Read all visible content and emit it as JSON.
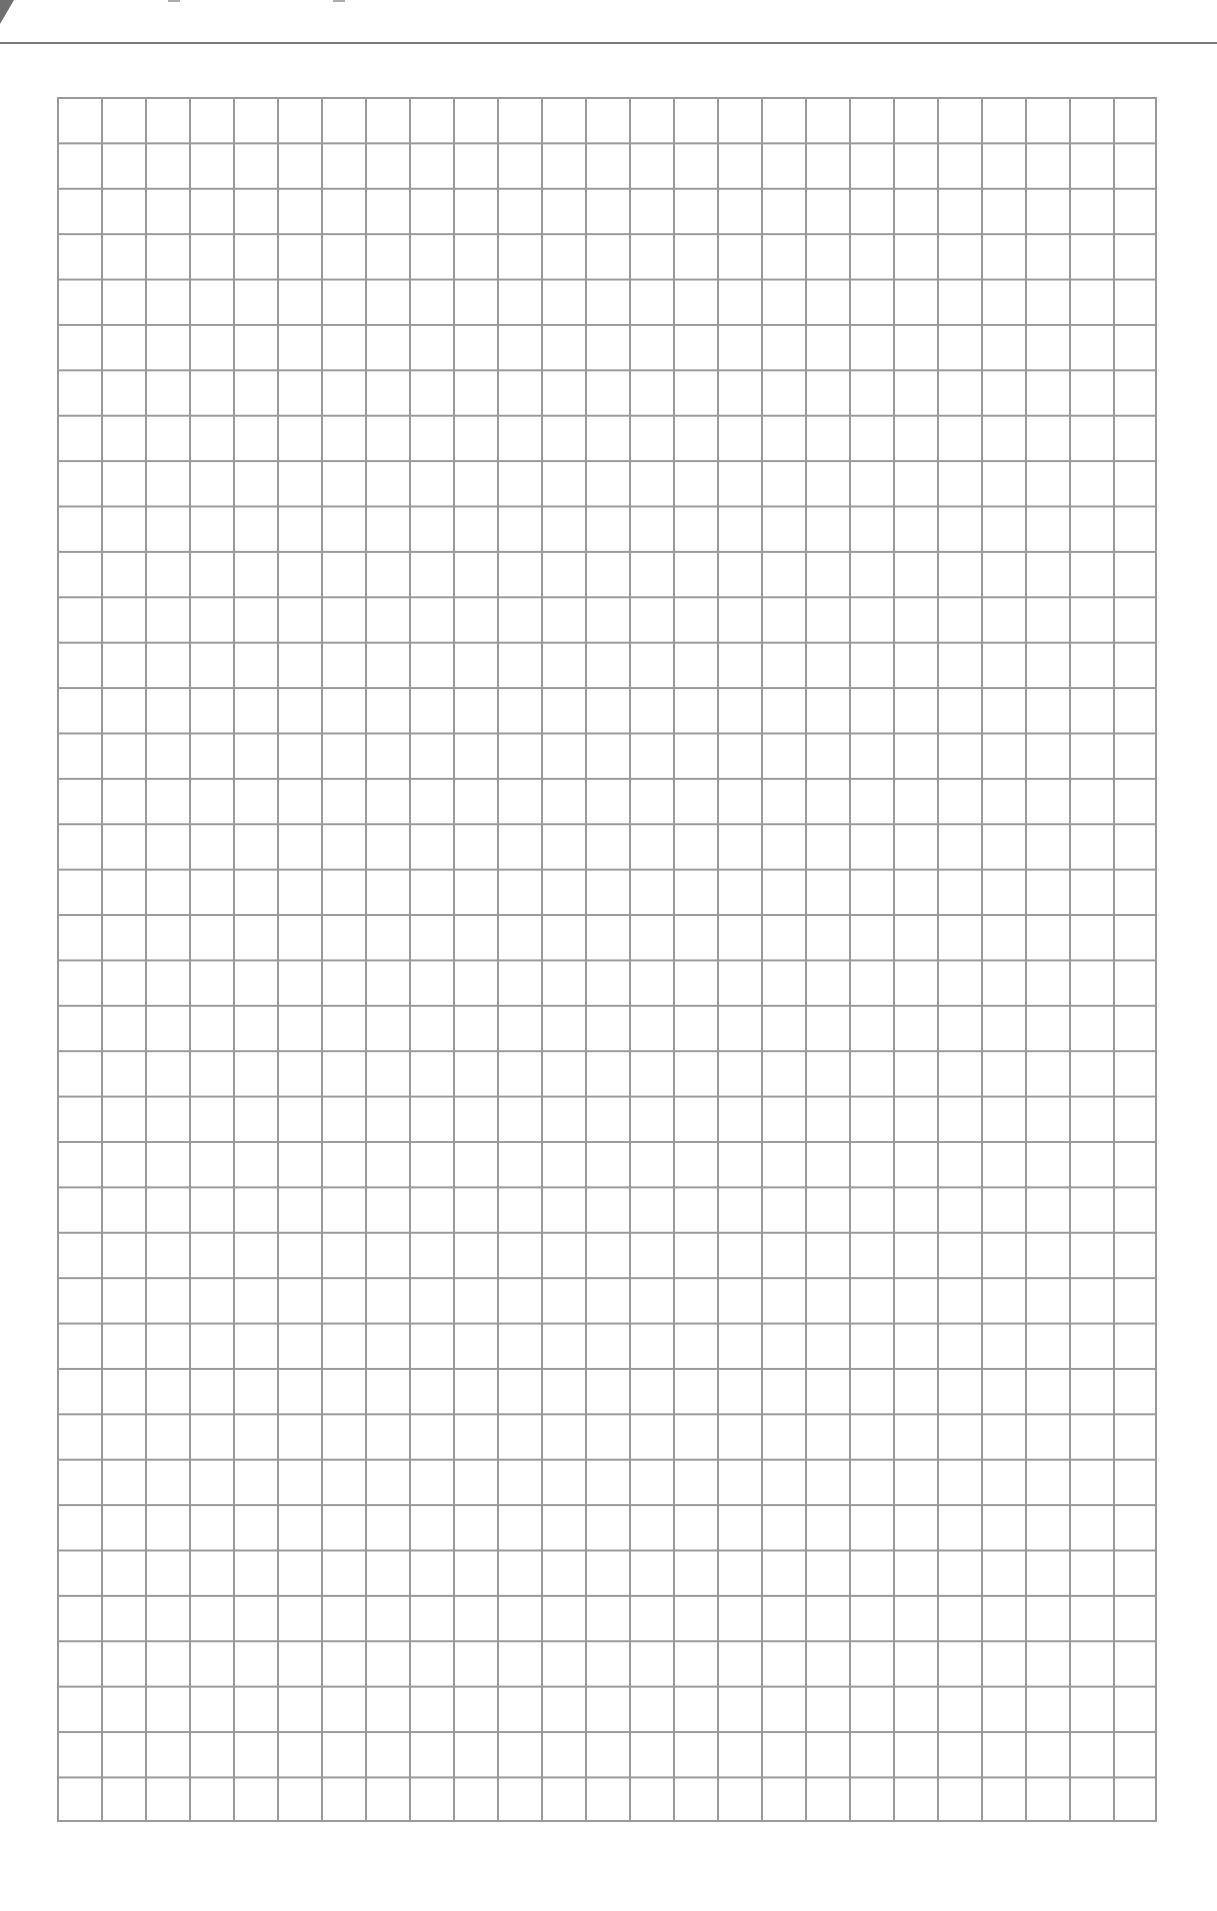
{
  "page": {
    "type": "graph-paper",
    "background_color": "#ffffff"
  },
  "header": {
    "title_visible_text": "",
    "title_fragments": [
      {
        "x": 168,
        "width": 12
      },
      {
        "x": 333,
        "width": 12
      }
    ],
    "corner_tab_color": "#6f6f6f",
    "rule_color": "#7a7a7a"
  },
  "grid": {
    "columns": 25,
    "rows": 38,
    "cell_width_px": 44,
    "cell_height_px": 45.4,
    "line_color": "#9a9a9a",
    "label": "Blank graph paper grid, 25 columns by 38 rows"
  }
}
